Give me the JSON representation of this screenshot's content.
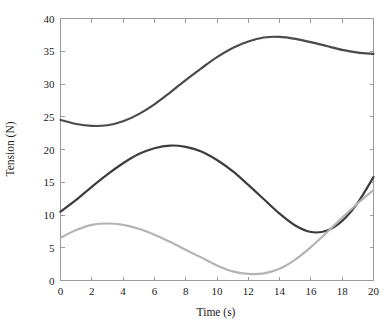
{
  "chart_data": {
    "type": "line",
    "title": "",
    "subtitle": "",
    "xlabel": "Time (s)",
    "ylabel": "Tension (N)",
    "xlim": [
      0,
      20
    ],
    "ylim": [
      0,
      40
    ],
    "xticks": [
      0,
      2,
      4,
      6,
      8,
      10,
      12,
      14,
      16,
      18,
      20
    ],
    "yticks": [
      0,
      5,
      10,
      15,
      20,
      25,
      30,
      35,
      40
    ],
    "xtick_labels": [
      "0",
      "2",
      "4",
      "6",
      "8",
      "10",
      "12",
      "14",
      "16",
      "18",
      "20"
    ],
    "ytick_labels": [
      "0",
      "5",
      "10",
      "15",
      "20",
      "25",
      "30",
      "35",
      "40"
    ],
    "grid": false,
    "legend": null,
    "legend_position": "none",
    "annotations": [],
    "x": [
      0,
      1,
      2,
      3,
      4,
      5,
      6,
      7,
      8,
      9,
      10,
      11,
      12,
      13,
      14,
      15,
      16,
      17,
      18,
      19,
      20
    ],
    "series": [
      {
        "name": "upper-curve",
        "color": "#4a4a4a",
        "linewidth": 2.2,
        "values": [
          24.5,
          23.9,
          23.6,
          23.7,
          24.3,
          25.4,
          26.9,
          28.7,
          30.6,
          32.4,
          34.1,
          35.5,
          36.5,
          37.1,
          37.2,
          36.9,
          36.4,
          35.8,
          35.2,
          34.8,
          34.6
        ]
      },
      {
        "name": "middle-curve",
        "color": "#3c3c3c",
        "linewidth": 2.2,
        "values": [
          10.5,
          12.3,
          14.3,
          16.2,
          17.9,
          19.3,
          20.2,
          20.6,
          20.4,
          19.7,
          18.4,
          16.7,
          14.6,
          12.4,
          10.2,
          8.4,
          7.4,
          7.6,
          9.1,
          11.9,
          15.8
        ]
      },
      {
        "name": "lower-curve",
        "color": "#b4b4b4",
        "linewidth": 2.2,
        "values": [
          6.5,
          7.7,
          8.5,
          8.7,
          8.5,
          7.9,
          7.0,
          5.9,
          4.7,
          3.5,
          2.3,
          1.4,
          1.0,
          1.1,
          1.8,
          3.2,
          5.1,
          7.3,
          9.6,
          11.8,
          13.8
        ]
      }
    ]
  },
  "axes": {
    "frame_color": "#9a9a9a"
  }
}
